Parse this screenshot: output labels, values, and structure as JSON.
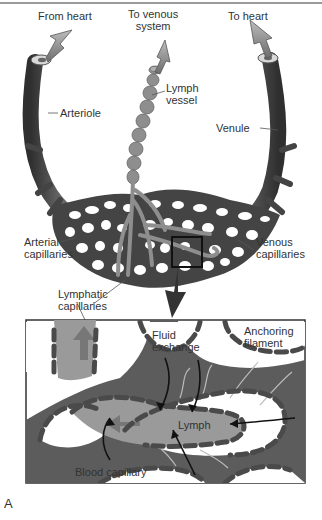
{
  "figure": {
    "letter": "A",
    "overview_labels": {
      "from_heart": "From heart",
      "to_venous_system": [
        "To venous",
        "system"
      ],
      "to_heart": "To heart",
      "lymph_vessel": [
        "Lymph",
        "vessel"
      ],
      "arteriole": "Arteriole",
      "venule": "Venule",
      "arterial_capillaries": [
        "Arterial",
        "capillaries"
      ],
      "venous_capillaries": [
        "Venous",
        "capillaries"
      ],
      "lymphatic_capillaries": [
        "Lymphatic",
        "capillaries"
      ]
    },
    "detail_labels": {
      "fluid_exchange": [
        "Fluid",
        "exchange"
      ],
      "anchoring_filament": [
        "Anchoring",
        "filament"
      ],
      "lymph": "Lymph",
      "blood_capillary": "Blood capillary"
    },
    "colors": {
      "vessel_dark": "#4a4a4a",
      "lymph_gray": "#9a9a9a",
      "detail_bg": "#5c5c5c",
      "text": "#333333"
    }
  }
}
